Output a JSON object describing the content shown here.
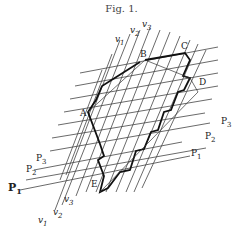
{
  "figure": {
    "caption": "Fig. 1.",
    "vertex_labels": {
      "A": "A",
      "B": "B",
      "C": "C",
      "D": "D",
      "E": "E"
    },
    "v_labels_top": [
      {
        "main": "v",
        "sub": "1"
      },
      {
        "main": "v",
        "sub": "2"
      },
      {
        "main": "v",
        "sub": "3"
      }
    ],
    "v_labels_bottom": [
      {
        "main": "v",
        "sub": "1"
      },
      {
        "main": "v",
        "sub": "2"
      },
      {
        "main": "v",
        "sub": "3"
      }
    ],
    "p_labels_left": [
      {
        "main": "P",
        "sub": "1"
      },
      {
        "main": "P",
        "sub": "2"
      },
      {
        "main": "P",
        "sub": "3"
      }
    ],
    "p_labels_right": [
      {
        "main": "P",
        "sub": "1"
      },
      {
        "main": "P",
        "sub": "2"
      },
      {
        "main": "P",
        "sub": "3"
      }
    ],
    "colors": {
      "lines": "#333333",
      "polygon": "#111111",
      "background": "#ffffff"
    }
  }
}
